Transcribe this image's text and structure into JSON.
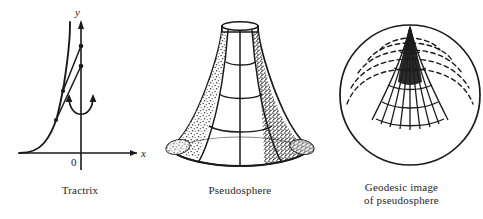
{
  "page": {
    "background_color": "#ffffff",
    "ink_color": "#1a1a1a",
    "width": 483,
    "height": 219
  },
  "figures": [
    {
      "id": "tractrix",
      "caption_lines": [
        "Tractrix"
      ],
      "axes": {
        "x_label": "x",
        "y_label": "y",
        "origin_label": "0"
      },
      "annotation": "rotation-arrow-about-y-axis",
      "curve_name": "tractrix-curve",
      "tangent_count": 2,
      "marker_count": 4
    },
    {
      "id": "pseudosphere",
      "caption_lines": [
        "Pseudosphere"
      ],
      "surface_name": "pseudosphere-surface",
      "features": [
        "flared-base-rim",
        "meridian-lines",
        "parallel-lines",
        "stippled-shading",
        "narrow-neck"
      ]
    },
    {
      "id": "geodesic-image",
      "caption_lines": [
        "Geodesic image",
        "of pseudosphere"
      ],
      "surface_name": "geodesic-disk",
      "features": [
        "bounding-circle",
        "radial-geodesics",
        "solid-parallels",
        "dashed-parallels",
        "cusp-point"
      ]
    }
  ]
}
